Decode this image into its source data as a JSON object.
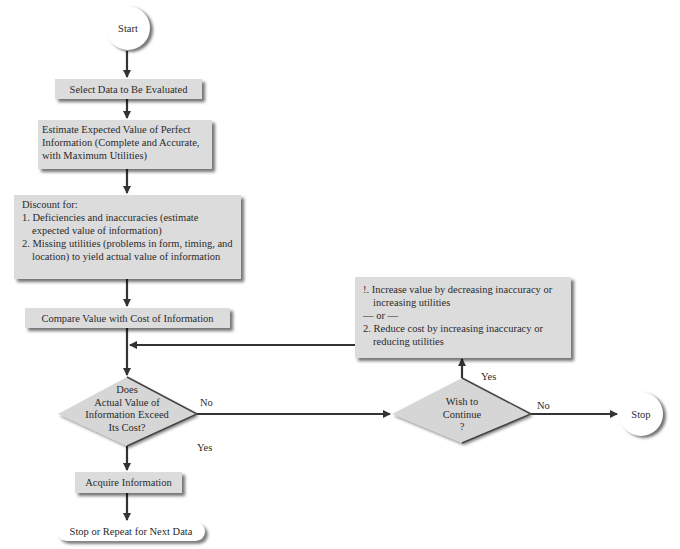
{
  "nodes": {
    "start": "Start",
    "select": "Select Data to Be Evaluated",
    "estimate": "Estimate Expected Value of Perfect Information (Complete and Accurate, with Maximum Utilities)",
    "discount": {
      "heading": "Discount for:",
      "items": [
        "1. Deficiencies and inaccuracies (estimate expected value of information)",
        "2. Missing utilities (problems in form, timing, and location) to yield actual value of information"
      ]
    },
    "compare": "Compare Value with Cost of Information",
    "decision1": [
      "Does",
      "Actual Value of",
      "Information Exceed",
      "Its Cost?"
    ],
    "acquire": "Acquire Information",
    "end_repeat": "Stop or Repeat for Next Data",
    "options": {
      "item1": "!. Increase value by decreasing inaccuracy or increasing utilities",
      "separator": "— or —",
      "item2": "2. Reduce cost by increasing inaccuracy or reducing utilities"
    },
    "decision2": [
      "Wish to",
      "Continue",
      "?"
    ],
    "stop": "Stop"
  },
  "edge_labels": {
    "d1_no": "No",
    "d1_yes": "Yes",
    "d2_yes": "Yes",
    "d2_no": "No"
  },
  "colors": {
    "box_fill": "#dcdcdc",
    "line": "#333333"
  }
}
